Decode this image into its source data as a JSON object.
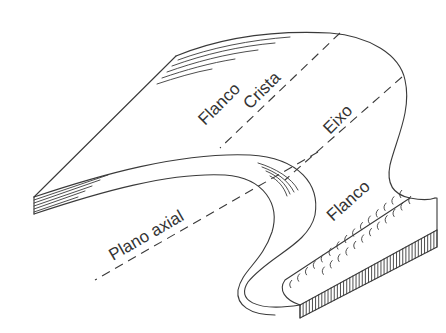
{
  "diagram": {
    "labels": {
      "flanco_top": "Flanco",
      "crista": "Crista",
      "eixo": "Eixo",
      "plano_axial": "Plano axial",
      "flanco_bottom": "Flanco"
    },
    "colors": {
      "line": "#3a3a3a",
      "text": "#333333",
      "background": "#ffffff"
    }
  }
}
